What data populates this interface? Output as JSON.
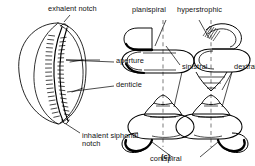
{
  "figure": {
    "caption": "(c)",
    "ink_color": "#000000",
    "background_color": "#ffffff",
    "axis_color": "#999999"
  },
  "labels": {
    "exhalent_notch": "exhalent notch",
    "aperture": "aperture",
    "denticle": "denticle",
    "inhalent_siphonal_notch": "inhalent siphonal notch",
    "planispiral": "planispiral",
    "hyperstrophic": "hyperstrophic",
    "sinistral": "sinistral",
    "dextral": "dextral",
    "conispiral": "conispiral"
  },
  "specimens": [
    {
      "name": "cowrie-ventral-view",
      "description": "Ventral view of a cowrie shell showing a narrow denticulate aperture running the length of the shell",
      "features": [
        "exhalent notch",
        "aperture",
        "denticle",
        "inhalent siphonal notch"
      ]
    },
    {
      "name": "planispiral-sinistral-shell",
      "coiling": "planispiral",
      "handedness": "sinistral"
    },
    {
      "name": "hyperstrophic-dextral-shell",
      "coiling": "hyperstrophic",
      "handedness": "dextral"
    },
    {
      "name": "conispiral-sinistral-shell",
      "coiling": "conispiral",
      "handedness": "sinistral"
    },
    {
      "name": "conispiral-dextral-shell",
      "coiling": "conispiral",
      "handedness": "dextral"
    }
  ]
}
